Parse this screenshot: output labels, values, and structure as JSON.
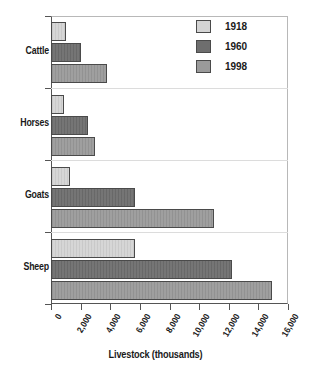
{
  "chart_data": {
    "type": "bar",
    "orientation": "horizontal",
    "title": "",
    "xlabel": "Livestock (thousands)",
    "ylabel": "",
    "xlim": [
      0,
      16000
    ],
    "xticks": [
      0,
      2000,
      4000,
      6000,
      8000,
      10000,
      12000,
      14000,
      16000
    ],
    "xtick_labels": [
      "0",
      "2,000",
      "4,000",
      "6,000",
      "8,000",
      "10,000",
      "12,000",
      "14,000",
      "16,000"
    ],
    "categories": [
      "Cattle",
      "Horses",
      "Goats",
      "Sheep"
    ],
    "grid": false,
    "legend_position": "top-right",
    "series": [
      {
        "name": "1918",
        "color": "#d4d4d4",
        "values": [
          1000,
          900,
          1300,
          5700
        ]
      },
      {
        "name": "1960",
        "color": "#6e6e6e",
        "values": [
          2000,
          2500,
          5700,
          12200
        ]
      },
      {
        "name": "1998",
        "color": "#9a9a9a",
        "values": [
          3800,
          3000,
          11000,
          14900
        ]
      }
    ]
  },
  "legend": {
    "items": [
      {
        "label": "1918"
      },
      {
        "label": "1960"
      },
      {
        "label": "1998"
      }
    ]
  }
}
